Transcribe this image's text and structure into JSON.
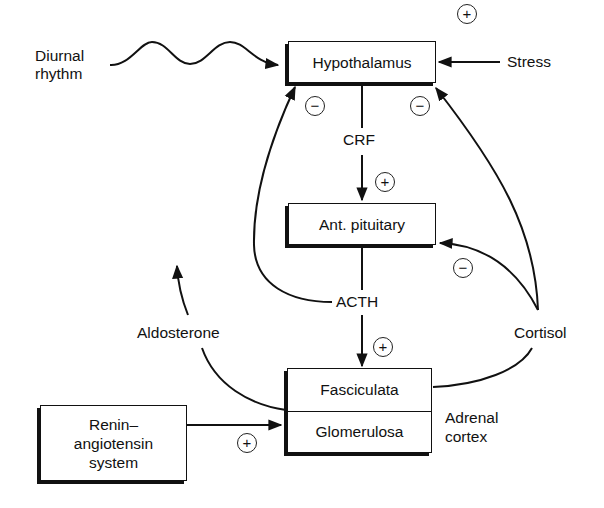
{
  "diagram": {
    "nodes": {
      "hypothalamus": "Hypothalamus",
      "pituitary": "Ant. pituitary",
      "fasciculata": "Fasciculata",
      "glomerulosa": "Glomerulosa",
      "renin": [
        "Renin–",
        "angiotensin",
        "system"
      ]
    },
    "labels": {
      "diurnal": [
        "Diurnal",
        "rhythm"
      ],
      "stress": "Stress",
      "crf": "CRF",
      "acth": "ACTH",
      "aldosterone": "Aldosterone",
      "cortisol": "Cortisol",
      "adrenal_cortex": [
        "Adrenal",
        "cortex"
      ]
    },
    "signs": {
      "stress_plus": "+",
      "acth_feedback_minus": "−",
      "cortisol_hypo_minus": "−",
      "crf_plus": "+",
      "cortisol_pit_minus": "−",
      "acth_plus": "+",
      "renin_plus": "+"
    },
    "edges": [
      {
        "from": "Diurnal rhythm",
        "to": "Hypothalamus",
        "style": "wavy"
      },
      {
        "from": "Stress",
        "to": "Hypothalamus",
        "sign": "+"
      },
      {
        "from": "Hypothalamus",
        "to": "Ant. pituitary",
        "via": "CRF",
        "sign": "+"
      },
      {
        "from": "Ant. pituitary",
        "to": "Fasciculata",
        "via": "ACTH",
        "sign": "+"
      },
      {
        "from": "ACTH",
        "to": "Hypothalamus",
        "sign": "−"
      },
      {
        "from": "Cortisol",
        "to": "Hypothalamus",
        "sign": "−"
      },
      {
        "from": "Cortisol",
        "to": "Ant. pituitary",
        "sign": "−"
      },
      {
        "from": "Fasciculata",
        "to": "Cortisol"
      },
      {
        "from": "Glomerulosa",
        "to": "Aldosterone"
      },
      {
        "from": "Renin–angiotensin system",
        "to": "Glomerulosa",
        "sign": "+"
      }
    ]
  }
}
